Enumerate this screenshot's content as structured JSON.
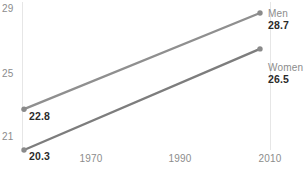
{
  "chart_data": {
    "type": "line",
    "title": "",
    "subtitle": "",
    "xlabel": "",
    "ylabel": "",
    "x": [
      1960,
      2011
    ],
    "xticks": [
      "1970",
      "1990",
      "2010"
    ],
    "xtick_values": [
      1970,
      1990,
      2010
    ],
    "yticks": [
      "29",
      "25",
      "21"
    ],
    "ytick_values": [
      29,
      25,
      21
    ],
    "ylim": [
      19.7,
      29.5
    ],
    "xlim": [
      1959,
      2013
    ],
    "grid": "faint-vertical",
    "legend_position": "right-of-line-end",
    "series": [
      {
        "name": "Men",
        "start_label": "22.8",
        "end_label": "28.7",
        "values": [
          22.8,
          28.7
        ],
        "color": "#8f8f8f"
      },
      {
        "name": "Women",
        "start_label": "20.3",
        "end_label": "26.5",
        "values": [
          20.3,
          26.5
        ],
        "color": "#7d7d7d"
      }
    ]
  },
  "axis": {
    "y": {
      "t0": "29",
      "t1": "25",
      "t2": "21"
    },
    "x": {
      "t0": "1970",
      "t1": "1990",
      "t2": "2010"
    }
  },
  "labels": {
    "men_start": "22.8",
    "men_name": "Men",
    "men_end": "28.7",
    "women_start": "20.3",
    "women_name": "Women",
    "women_end": "26.5"
  },
  "colors": {
    "men_line": "#8f8f8f",
    "women_line": "#7d7d7d",
    "marker": "#8a8a8a",
    "tick_text": "#8c8c8c",
    "value_text": "#2b2b2b",
    "grid": "#e6e6e6",
    "background": "#ffffff"
  }
}
